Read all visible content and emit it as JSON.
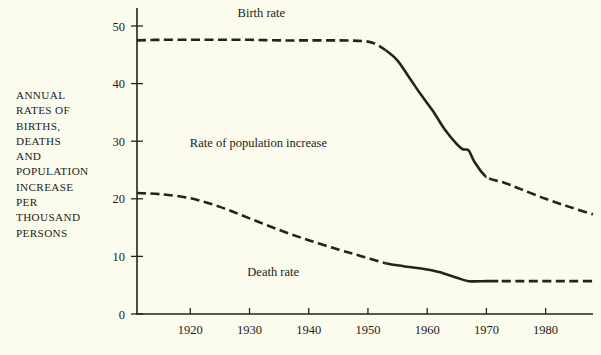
{
  "figure": {
    "axis_label": "ANNUAL\nRATES OF\nBIRTHS,\nDEATHS\nAND\nPOPULATION\nINCREASE\nPER\nTHOUSAND\nPERSONS",
    "background_color": "#fbfbee",
    "ink_color": "#24241f"
  },
  "chart_data": {
    "type": "line",
    "title": "",
    "subtitle": "",
    "xlabel": "",
    "ylabel": "ANNUAL RATES OF BIRTHS, DEATHS AND POPULATION INCREASE PER THOUSAND PERSONS",
    "xlim": [
      1911,
      1988
    ],
    "ylim": [
      0,
      52
    ],
    "grid": false,
    "legend_position": "inline-annotations",
    "xticks": [
      1920,
      1930,
      1940,
      1950,
      1960,
      1970,
      1980
    ],
    "xtick_labels": [
      "1920",
      "1930",
      "1940",
      "1950",
      "1960",
      "1970",
      "1980"
    ],
    "yticks": [
      0,
      10,
      20,
      30,
      40,
      50
    ],
    "ytick_labels": [
      "0",
      "10",
      "20",
      "30",
      "40",
      "50"
    ],
    "annotations": [
      {
        "name": "birth-rate-label",
        "text": "Birth rate",
        "x": 1932,
        "y": 51.5
      },
      {
        "name": "population-increase-label",
        "text": "Rate of population increase",
        "x": 1931.5,
        "y": 29.0
      },
      {
        "name": "death-rate-label",
        "text": "Death rate",
        "x": 1934,
        "y": 6.6
      }
    ],
    "series": [
      {
        "name": "Birth rate",
        "estimated_style": "dashed",
        "observed_style": "solid",
        "observed_range": [
          1953,
          1970
        ],
        "x": [
          1911,
          1915,
          1920,
          1925,
          1930,
          1935,
          1940,
          1945,
          1949,
          1951,
          1953,
          1955,
          1957,
          1959,
          1961,
          1963,
          1965,
          1966,
          1967,
          1968,
          1970,
          1973,
          1976,
          1980,
          1984,
          1988
        ],
        "values": [
          47.5,
          47.6,
          47.6,
          47.6,
          47.6,
          47.5,
          47.5,
          47.5,
          47.4,
          47.0,
          45.8,
          44.0,
          41.0,
          38.0,
          35.2,
          32.0,
          29.5,
          28.6,
          28.4,
          26.4,
          23.8,
          22.8,
          21.6,
          20.0,
          18.6,
          17.3
        ]
      },
      {
        "name": "Death rate",
        "estimated_style": "dashed",
        "observed_style": "solid",
        "observed_range": [
          1953,
          1972
        ],
        "x": [
          1911,
          1915,
          1920,
          1925,
          1930,
          1935,
          1940,
          1945,
          1949,
          1953,
          1956,
          1959,
          1962,
          1965,
          1967,
          1970,
          1972,
          1976,
          1980,
          1984,
          1988
        ],
        "values": [
          21.0,
          20.8,
          20.1,
          18.6,
          16.6,
          14.6,
          12.8,
          11.2,
          10.0,
          8.8,
          8.3,
          7.9,
          7.3,
          6.3,
          5.7,
          5.7,
          5.7,
          5.7,
          5.7,
          5.7,
          5.7
        ]
      }
    ]
  }
}
